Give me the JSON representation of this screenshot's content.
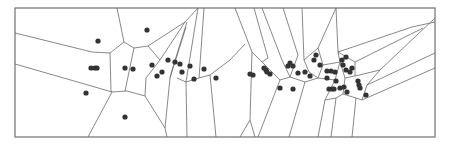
{
  "figure": {
    "type": "voronoi-diagram",
    "colors": {
      "background": "#ffffff",
      "frame": "#707070",
      "edge": "#6a6a6a",
      "site": "#333333"
    },
    "frame": {
      "x": 15,
      "y": 8,
      "width": 420,
      "height": 129
    },
    "site_radius": 2.6,
    "sites": [
      [
        98,
        41
      ],
      [
        91,
        68
      ],
      [
        95,
        68
      ],
      [
        97,
        68
      ],
      [
        86,
        93
      ],
      [
        125,
        117
      ],
      [
        125,
        68
      ],
      [
        133,
        69
      ],
      [
        147,
        30
      ],
      [
        152,
        65
      ],
      [
        157,
        76
      ],
      [
        162,
        72
      ],
      [
        168,
        60
      ],
      [
        175,
        62
      ],
      [
        180,
        64
      ],
      [
        182,
        72
      ],
      [
        190,
        66
      ],
      [
        194,
        79
      ],
      [
        204,
        69
      ],
      [
        216,
        78
      ],
      [
        250,
        74
      ],
      [
        253,
        75
      ],
      [
        264,
        68
      ],
      [
        266,
        70
      ],
      [
        267,
        72
      ],
      [
        270,
        74
      ],
      [
        280,
        88
      ],
      [
        293,
        89
      ],
      [
        288,
        66
      ],
      [
        290,
        63
      ],
      [
        293,
        66
      ],
      [
        298,
        73
      ],
      [
        305,
        72
      ],
      [
        310,
        76
      ],
      [
        316,
        55
      ],
      [
        314,
        60
      ],
      [
        320,
        65
      ],
      [
        327,
        71
      ],
      [
        331,
        71
      ],
      [
        335,
        72
      ],
      [
        342,
        60
      ],
      [
        346,
        57
      ],
      [
        343,
        65
      ],
      [
        346,
        70
      ],
      [
        350,
        72
      ],
      [
        352,
        68
      ],
      [
        336,
        81
      ],
      [
        329,
        89
      ],
      [
        332,
        89
      ],
      [
        334,
        89
      ],
      [
        344,
        87
      ],
      [
        347,
        92
      ],
      [
        358,
        81
      ],
      [
        359,
        85
      ],
      [
        360,
        88
      ],
      [
        366,
        95
      ],
      [
        340,
        88
      ],
      [
        327,
        78
      ]
    ],
    "edges": [
      [
        15,
        33,
        92,
        52
      ],
      [
        92,
        52,
        110,
        53
      ],
      [
        15,
        64,
        88,
        85
      ],
      [
        88,
        85,
        112,
        92
      ],
      [
        117,
        8,
        124,
        42
      ],
      [
        124,
        42,
        110,
        53
      ],
      [
        124,
        42,
        134,
        48
      ],
      [
        134,
        48,
        148,
        46
      ],
      [
        110,
        53,
        111,
        91
      ],
      [
        111,
        91,
        112,
        92
      ],
      [
        112,
        92,
        127,
        91
      ],
      [
        127,
        91,
        145,
        96
      ],
      [
        134,
        48,
        125,
        91
      ],
      [
        112,
        92,
        88,
        137
      ],
      [
        145,
        96,
        165,
        128
      ],
      [
        165,
        128,
        167,
        137
      ],
      [
        148,
        46,
        160,
        60
      ],
      [
        145,
        96,
        146,
        78
      ],
      [
        146,
        78,
        160,
        60
      ],
      [
        160,
        60,
        185,
        22
      ],
      [
        148,
        46,
        185,
        22
      ],
      [
        172,
        70,
        187,
        22
      ],
      [
        172,
        70,
        170,
        78
      ],
      [
        170,
        78,
        186,
        27
      ],
      [
        165,
        128,
        170,
        78
      ],
      [
        186,
        82,
        198,
        8
      ],
      [
        186,
        82,
        177,
        78
      ],
      [
        186,
        82,
        199,
        78
      ],
      [
        199,
        78,
        204,
        8
      ],
      [
        199,
        78,
        210,
        75
      ],
      [
        210,
        75,
        230,
        60
      ],
      [
        230,
        60,
        245,
        44
      ],
      [
        210,
        75,
        216,
        137
      ],
      [
        186,
        82,
        187,
        137
      ],
      [
        185,
        22,
        198,
        8
      ],
      [
        235,
        8,
        252,
        52
      ],
      [
        252,
        52,
        250,
        120
      ],
      [
        252,
        52,
        262,
        62
      ],
      [
        250,
        120,
        240,
        137
      ],
      [
        250,
        120,
        255,
        137
      ],
      [
        262,
        62,
        280,
        80
      ],
      [
        280,
        80,
        258,
        137
      ],
      [
        280,
        80,
        290,
        77
      ],
      [
        254,
        8,
        268,
        58
      ],
      [
        268,
        58,
        262,
        62
      ],
      [
        262,
        8,
        282,
        60
      ],
      [
        282,
        60,
        290,
        77
      ],
      [
        283,
        8,
        298,
        55
      ],
      [
        298,
        55,
        290,
        77
      ],
      [
        290,
        77,
        305,
        82
      ],
      [
        305,
        82,
        289,
        137
      ],
      [
        305,
        82,
        318,
        78
      ],
      [
        318,
        78,
        309,
        72
      ],
      [
        309,
        72,
        304,
        60
      ],
      [
        304,
        60,
        318,
        48
      ],
      [
        318,
        48,
        323,
        65
      ],
      [
        323,
        65,
        318,
        78
      ],
      [
        318,
        48,
        336,
        8
      ],
      [
        323,
        65,
        340,
        62
      ],
      [
        340,
        62,
        338,
        52
      ],
      [
        338,
        52,
        336,
        8
      ],
      [
        340,
        62,
        335,
        80
      ],
      [
        335,
        80,
        318,
        78
      ],
      [
        335,
        80,
        325,
        100
      ],
      [
        325,
        100,
        318,
        137
      ],
      [
        325,
        100,
        336,
        98
      ],
      [
        336,
        98,
        331,
        137
      ],
      [
        336,
        98,
        343,
        94
      ],
      [
        343,
        94,
        356,
        98
      ],
      [
        356,
        98,
        352,
        137
      ],
      [
        343,
        94,
        345,
        78
      ],
      [
        345,
        78,
        340,
        62
      ],
      [
        345,
        78,
        355,
        76
      ],
      [
        355,
        76,
        355,
        62
      ],
      [
        355,
        62,
        338,
        52
      ],
      [
        355,
        62,
        423,
        28
      ],
      [
        355,
        76,
        380,
        70
      ],
      [
        380,
        70,
        435,
        18
      ],
      [
        380,
        70,
        367,
        85
      ],
      [
        367,
        85,
        435,
        53
      ],
      [
        367,
        85,
        362,
        100
      ],
      [
        362,
        100,
        435,
        68
      ],
      [
        362,
        100,
        356,
        98
      ],
      [
        338,
        52,
        412,
        27
      ],
      [
        412,
        27,
        435,
        22
      ],
      [
        302,
        8,
        304,
        60
      ]
    ]
  }
}
